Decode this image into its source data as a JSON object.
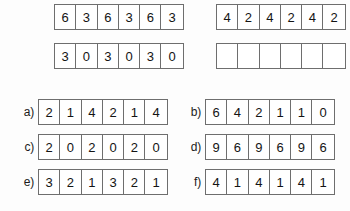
{
  "worksheet": {
    "rows": [
      {
        "id": "row-top-1",
        "left": {
          "label": "",
          "values": [
            "6",
            "3",
            "6",
            "3",
            "6",
            "3"
          ],
          "blank": false
        },
        "right": {
          "label": "",
          "values": [
            "4",
            "2",
            "4",
            "2",
            "4",
            "2"
          ],
          "blank": false
        }
      },
      {
        "id": "row-top-2",
        "left": {
          "label": "",
          "values": [
            "3",
            "0",
            "3",
            "0",
            "3",
            "0"
          ],
          "blank": false
        },
        "right": {
          "label": "",
          "values": [
            "",
            "",
            "",
            "",
            "",
            ""
          ],
          "blank": true
        }
      },
      {
        "id": "row-ab",
        "left": {
          "label": "a)",
          "values": [
            "2",
            "1",
            "4",
            "2",
            "1",
            "4"
          ],
          "blank": false
        },
        "right": {
          "label": "b)",
          "values": [
            "6",
            "4",
            "2",
            "1",
            "1",
            "0"
          ],
          "blank": false
        }
      },
      {
        "id": "row-cd",
        "left": {
          "label": "c)",
          "values": [
            "2",
            "0",
            "2",
            "0",
            "2",
            "0"
          ],
          "blank": false
        },
        "right": {
          "label": "d)",
          "values": [
            "9",
            "6",
            "9",
            "6",
            "9",
            "6"
          ],
          "blank": false
        }
      },
      {
        "id": "row-ef",
        "left": {
          "label": "e)",
          "values": [
            "3",
            "2",
            "1",
            "3",
            "2",
            "1"
          ],
          "blank": false
        },
        "right": {
          "label": "f)",
          "values": [
            "4",
            "1",
            "4",
            "1",
            "4",
            "1"
          ],
          "blank": false
        }
      }
    ],
    "colors": {
      "background": "#fdfdfd",
      "cell_background": "#ffffff",
      "border": "#6e6e6e",
      "text": "#141414"
    }
  }
}
